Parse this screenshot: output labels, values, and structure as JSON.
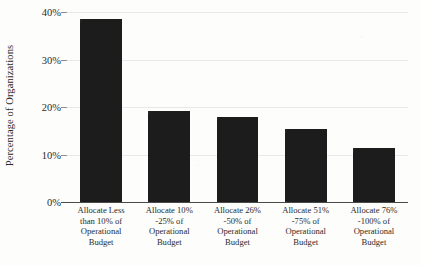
{
  "chart_data": {
    "type": "bar",
    "title": "",
    "xlabel": "",
    "ylabel": "Percentage of Organizations",
    "ylim": [
      0,
      40
    ],
    "ytick_labels": [
      "0%",
      "10%",
      "20%",
      "30%",
      "40%"
    ],
    "ytick_values": [
      0,
      10,
      20,
      30,
      40
    ],
    "grid": true,
    "legend": "none",
    "categories": [
      "Allocate Less than 10% of Operational Budget",
      "Allocate 10% -25% of Operational Budget",
      "Allocate 26% -50% of Operational Budget",
      "Allocate 51% -75% of Operational Budget",
      "Allocate 76% -100% of Operational Budget"
    ],
    "category_lines": [
      [
        "Allocate Less",
        "than 10% of",
        "Operational",
        "Budget"
      ],
      [
        "Allocate 10%",
        "-25% of",
        "Operational",
        "Budget"
      ],
      [
        "Allocate 26%",
        "-50% of",
        "Operational",
        "Budget"
      ],
      [
        "Allocate 51%",
        "-75% of",
        "Operational",
        "Budget"
      ],
      [
        "Allocate 76%",
        "-100% of",
        "Operational",
        "Budget"
      ]
    ],
    "values": [
      38.6,
      19.2,
      17.9,
      15.3,
      11.4
    ],
    "bar_color": "#1c1c1c",
    "gridline_color": "#e8e8e8",
    "axis_color": "#4a4a4a",
    "background_color": "#fdfdfc"
  }
}
